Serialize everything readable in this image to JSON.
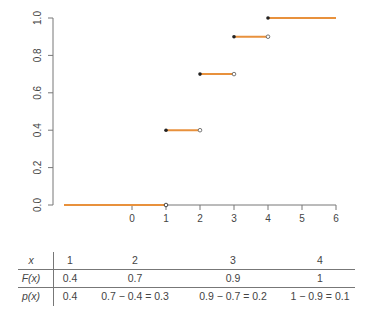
{
  "chart_data": {
    "type": "line",
    "subtype": "step-cdf",
    "title": "",
    "xlabel": "",
    "ylabel": "",
    "xlim": [
      -2,
      6
    ],
    "ylim": [
      0,
      1
    ],
    "x_ticks": [
      "0",
      "1",
      "2",
      "3",
      "4",
      "5",
      "6"
    ],
    "x_tick_values": [
      0,
      1,
      2,
      3,
      4,
      5,
      6
    ],
    "y_ticks": [
      "0.0",
      "0.2",
      "0.4",
      "0.6",
      "0.8",
      "1.0"
    ],
    "y_tick_values": [
      0,
      0.2,
      0.4,
      0.6,
      0.8,
      1.0
    ],
    "grid": false,
    "colors": {
      "step": "#e8913c",
      "axis": "#777777",
      "point": "#222222"
    },
    "segments": [
      {
        "x_start": -2,
        "x_end": 1,
        "y": 0.0,
        "closed_start": false,
        "open_end": false
      },
      {
        "x_start": 1,
        "x_end": 2,
        "y": 0.4,
        "closed_start": true,
        "open_end": true
      },
      {
        "x_start": 2,
        "x_end": 3,
        "y": 0.7,
        "closed_start": true,
        "open_end": true
      },
      {
        "x_start": 3,
        "x_end": 4,
        "y": 0.9,
        "closed_start": true,
        "open_end": true
      },
      {
        "x_start": 4,
        "x_end": 6,
        "y": 1.0,
        "closed_start": true,
        "open_end": false
      }
    ],
    "jump_points": [
      {
        "x": 1,
        "y": 0.0,
        "type": "open"
      }
    ]
  },
  "table": {
    "row_headers": [
      "x",
      "F(x)",
      "p(x)"
    ],
    "rows": [
      [
        "1",
        "2",
        "3",
        "4"
      ],
      [
        "0.4",
        "0.7",
        "0.9",
        "1"
      ],
      [
        "0.4",
        "0.7 − 0.4 = 0.3",
        "0.9 − 0.7 = 0.2",
        "1 − 0.9 = 0.1"
      ]
    ]
  }
}
